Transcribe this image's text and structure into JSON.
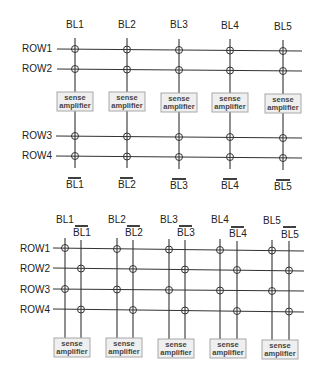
{
  "top_diagram": {
    "title": "open bitline architecture",
    "bitlines": [
      "BL1",
      "BL2",
      "BL3",
      "BL4",
      "BL5"
    ],
    "bitline_bars": [
      "BL1",
      "BL2",
      "BL3",
      "BL4",
      "BL5"
    ],
    "rows_upper": [
      "ROW1",
      "ROW2"
    ],
    "rows_lower": [
      "ROW3",
      "ROW4"
    ],
    "sense_amp": {
      "line1": "sense",
      "line2": "amplifier"
    }
  },
  "bottom_diagram": {
    "title": "folded bitline architecture",
    "bitlines": [
      "BL1",
      "BL2",
      "BL3",
      "BL4",
      "BL5"
    ],
    "bitline_bars": [
      "BL1",
      "BL2",
      "BL3",
      "BL4",
      "BL5"
    ],
    "rows": [
      "ROW1",
      "ROW2",
      "ROW3",
      "ROW4"
    ],
    "sense_amp": {
      "line1": "sense",
      "line2": "amplifier"
    }
  },
  "colors": {
    "wire": "#333333",
    "sense_amp_fill": "#efefef",
    "sense_amp_border": "#a8a8a8",
    "text": "#222222"
  }
}
